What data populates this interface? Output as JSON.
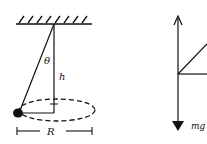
{
  "diagram": {
    "left_figure": {
      "labels": {
        "angle": "θ",
        "height": "h",
        "radius": "R"
      }
    },
    "right_figure": {
      "labels": {
        "weight": "mg"
      }
    },
    "colors": {
      "ink": "#111111",
      "background": "#ffffff"
    }
  }
}
